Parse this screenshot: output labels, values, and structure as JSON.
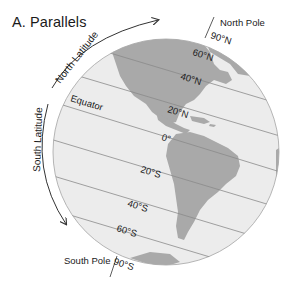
{
  "title": "A. Parallels",
  "colors": {
    "ocean": "#ececec",
    "land": "#a9a9a9",
    "parallel_line": "#8a8a8a",
    "globe_edge": "#b5b5b5",
    "arrow": "#333333",
    "text": "#1a1a1a"
  },
  "arcs": {
    "north": {
      "label": "North Latitude",
      "direction": "arrow-up-right"
    },
    "south": {
      "label": "South Latitude",
      "direction": "arrow-down"
    }
  },
  "poles": {
    "north": {
      "label": "North Pole",
      "latitude": "90°N"
    },
    "south": {
      "label": "South Pole",
      "latitude": "90°S"
    }
  },
  "parallels": [
    {
      "id": "n60",
      "label": "60°N"
    },
    {
      "id": "n40",
      "label": "40°N"
    },
    {
      "id": "n20",
      "label": "20°N"
    },
    {
      "id": "eq",
      "label": "0°",
      "name": "Equator"
    },
    {
      "id": "s20",
      "label": "20°S"
    },
    {
      "id": "s40",
      "label": "40°S"
    },
    {
      "id": "s60",
      "label": "60°S"
    }
  ]
}
